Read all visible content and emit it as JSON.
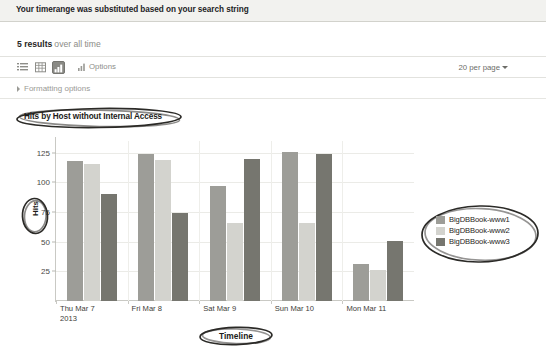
{
  "banner": {
    "message": "Your timerange was substituted based on your search string"
  },
  "results": {
    "count_label": "5 results",
    "scope_label": "over all time"
  },
  "toolbar": {
    "icons": [
      {
        "name": "list-view-icon",
        "label": "List view",
        "selected": false
      },
      {
        "name": "table-view-icon",
        "label": "Table view",
        "selected": false
      },
      {
        "name": "chart-view-icon",
        "label": "Chart view",
        "selected": true
      }
    ],
    "options_label": "Options",
    "per_page_label": "20 per page"
  },
  "formatting": {
    "label": "Formatting options"
  },
  "annotations": {
    "title": "Hits by Host without Internal Access",
    "yaxis": "Hits",
    "xaxis": "Timeline"
  },
  "colors": {
    "series1": "#9d9d98",
    "series2": "#d3d3ce",
    "series3": "#76766f",
    "gridline": "#ebebe7",
    "axis": "#c9c9c4",
    "annotation_ink": "#2b2a27",
    "toolbar_selected": "#8a8a85"
  },
  "chart_data": {
    "type": "bar",
    "title": "Hits by Host without Internal Access",
    "xlabel": "Timeline",
    "ylabel": "Hits",
    "ylim": [
      0,
      135
    ],
    "yticks": [
      25,
      50,
      75,
      100,
      125
    ],
    "grid": true,
    "legend_position": "right",
    "categories": [
      "Thu Mar 7\n2013",
      "Fri Mar 8",
      "Sat Mar 9",
      "Sun Mar 10",
      "Mon Mar 11"
    ],
    "series": [
      {
        "name": "BigDBBook-www1",
        "color": "#9d9d98",
        "values": [
          118,
          124,
          97,
          126,
          31
        ]
      },
      {
        "name": "BigDBBook-www2",
        "color": "#d3d3ce",
        "values": [
          116,
          119,
          66,
          66,
          26
        ]
      },
      {
        "name": "BigDBBook-www3",
        "color": "#76766f",
        "values": [
          90,
          74,
          120,
          124,
          51
        ]
      }
    ]
  }
}
